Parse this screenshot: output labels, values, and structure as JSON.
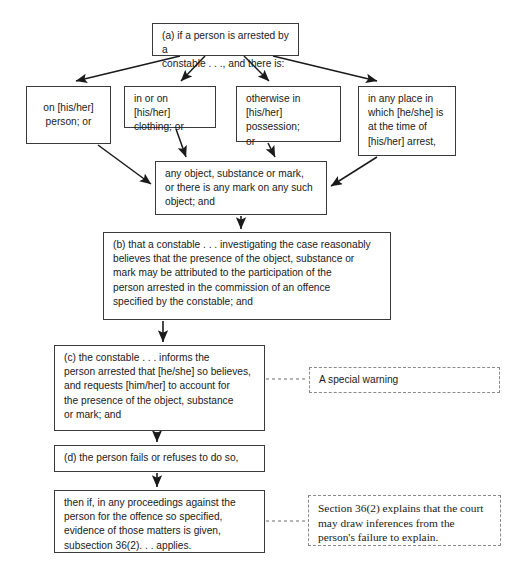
{
  "diagram": {
    "canvas": {
      "width": 527,
      "height": 574
    },
    "colors": {
      "background": "#ffffff",
      "box_border": "#3a3a3a",
      "annotation_border": "#8a8a8a",
      "text": "#1a1a1a",
      "arrow": "#1a1a1a",
      "dotted_connector": "#6a6a6a"
    },
    "nodes": {
      "a": {
        "label": "(a) if a person is arrested by a\nconstable . . ., and there is:",
        "x": 152,
        "y": 23,
        "w": 147,
        "h": 33
      },
      "opt1": {
        "label": "on [his/her]\nperson; or",
        "x": 26,
        "y": 86,
        "w": 85,
        "h": 58
      },
      "opt2": {
        "label": "in or on [his/her]\nclothing; or",
        "x": 124,
        "y": 86,
        "w": 92,
        "h": 42
      },
      "opt3": {
        "label": "otherwise in\n[his/her] possession;\n or",
        "x": 236,
        "y": 86,
        "w": 105,
        "h": 56
      },
      "opt4": {
        "label": "in any place in\nwhich [he/she] is\nat the time of\n[his/her] arrest,",
        "x": 358,
        "y": 86,
        "w": 98,
        "h": 70
      },
      "object": {
        "label": "any object, substance or mark,\nor there is any mark on any such\nobject; and",
        "x": 155,
        "y": 161,
        "w": 172,
        "h": 54
      },
      "b": {
        "label": "(b) that a constable . . . investigating the case reasonably\nbelieves that the presence of the object, substance or\nmark may be attributed to the participation of the\nperson arrested in the commission of an offence\nspecified by the constable; and",
        "x": 103,
        "y": 232,
        "w": 288,
        "h": 88
      },
      "c": {
        "label": "(c) the constable . . . informs the\nperson arrested that [he/she] so believes,\nand requests [him/her] to account for\nthe presence of the object, substance\nor mark; and",
        "x": 54,
        "y": 345,
        "w": 211,
        "h": 86
      },
      "d": {
        "label": "(d) the person fails or refuses to do so,",
        "x": 54,
        "y": 445,
        "w": 211,
        "h": 27
      },
      "then": {
        "label": "then if, in any proceedings against the\nperson for the offence so specified,\nevidence of those matters is given,\n subsection 36(2). . . applies.",
        "x": 54,
        "y": 490,
        "w": 211,
        "h": 63
      }
    },
    "annotations": {
      "special_warning": {
        "label": "A special warning",
        "x": 309,
        "y": 367,
        "w": 191,
        "h": 26
      },
      "section362": {
        "label": "Section 36(2) explains that the court\nmay draw inferences from the\nperson's failure to explain.",
        "x": 308,
        "y": 495,
        "w": 193,
        "h": 51
      }
    },
    "edges": [
      {
        "name": "a-to-opt1",
        "from": "a",
        "to": "opt1",
        "style": "solid-arrow"
      },
      {
        "name": "a-to-opt2",
        "from": "a",
        "to": "opt2",
        "style": "solid-arrow"
      },
      {
        "name": "a-to-opt3",
        "from": "a",
        "to": "opt3",
        "style": "solid-arrow"
      },
      {
        "name": "a-to-opt4",
        "from": "a",
        "to": "opt4",
        "style": "solid-arrow"
      },
      {
        "name": "opt1-to-object",
        "from": "opt1",
        "to": "object",
        "style": "solid-arrow"
      },
      {
        "name": "opt2-to-object",
        "from": "opt2",
        "to": "object",
        "style": "solid-arrow"
      },
      {
        "name": "opt3-to-object",
        "from": "opt3",
        "to": "object",
        "style": "solid-arrow"
      },
      {
        "name": "opt4-to-object",
        "from": "opt4",
        "to": "object",
        "style": "solid-arrow"
      },
      {
        "name": "object-to-b",
        "from": "object",
        "to": "b",
        "style": "solid-arrow"
      },
      {
        "name": "b-to-c",
        "from": "b",
        "to": "c",
        "style": "solid-arrow"
      },
      {
        "name": "c-to-d",
        "from": "c",
        "to": "d",
        "style": "solid-arrow"
      },
      {
        "name": "d-to-then",
        "from": "d",
        "to": "then",
        "style": "solid-arrow"
      },
      {
        "name": "c-to-special-warning",
        "from": "c",
        "to": "special_warning",
        "style": "dotted"
      },
      {
        "name": "then-to-section362",
        "from": "then",
        "to": "section362",
        "style": "dotted"
      }
    ]
  }
}
